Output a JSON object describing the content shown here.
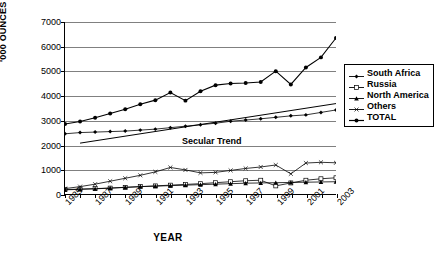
{
  "chart_data": {
    "type": "line",
    "title": "",
    "xlabel": "YEAR",
    "ylabel": "'000 OUNCES",
    "ylim": [
      0,
      7000
    ],
    "ytick_values": [
      0,
      1000,
      2000,
      3000,
      4000,
      5000,
      6000,
      7000
    ],
    "ytick_labels": [
      "0",
      "1000",
      "2000",
      "3000",
      "4000",
      "5000",
      "6000",
      "7000"
    ],
    "grid": true,
    "legend_position": "right",
    "x": [
      1985,
      1986,
      1987,
      1988,
      1989,
      1990,
      1991,
      1992,
      1993,
      1994,
      1995,
      1996,
      1997,
      1998,
      1999,
      2000,
      2001,
      2002,
      2003
    ],
    "xtick_labels": [
      "1985",
      "1987",
      "1989",
      "1991",
      "1993",
      "1995",
      "1997",
      "1999",
      "2001",
      "2003"
    ],
    "annotations": [
      {
        "text": "Secular Trend",
        "x": 1993,
        "y": 2150
      }
    ],
    "series": [
      {
        "name": "South Africa",
        "marker": "diamond",
        "values": [
          2450,
          2500,
          2520,
          2540,
          2560,
          2600,
          2640,
          2700,
          2760,
          2820,
          2880,
          2960,
          3010,
          3060,
          3120,
          3180,
          3220,
          3320,
          3420
        ]
      },
      {
        "name": "Russia",
        "marker": "square",
        "values": [
          180,
          200,
          220,
          240,
          270,
          300,
          330,
          360,
          390,
          420,
          460,
          500,
          540,
          560,
          330,
          450,
          560,
          620,
          660
        ]
      },
      {
        "name": "North America",
        "marker": "triangle",
        "values": [
          170,
          190,
          210,
          240,
          270,
          300,
          320,
          340,
          360,
          380,
          400,
          420,
          440,
          450,
          460,
          470,
          480,
          490,
          500
        ]
      },
      {
        "name": "Others",
        "marker": "cross",
        "values": [
          220,
          300,
          400,
          520,
          640,
          760,
          900,
          1080,
          980,
          860,
          880,
          960,
          1040,
          1100,
          1180,
          820,
          1260,
          1290,
          1270
        ]
      },
      {
        "name": "TOTAL",
        "marker": "circle",
        "values": [
          2850,
          2950,
          3100,
          3280,
          3450,
          3650,
          3820,
          4130,
          3800,
          4180,
          4430,
          4500,
          4520,
          4560,
          5000,
          4460,
          5150,
          5560,
          6350
        ]
      }
    ],
    "trend_line": {
      "name": "Secular Trend",
      "x": [
        1986,
        2003
      ],
      "y": [
        2070,
        3680
      ]
    }
  },
  "legend": {
    "items": [
      {
        "label": "South Africa"
      },
      {
        "label": "Russia"
      },
      {
        "label": "North America"
      },
      {
        "label": "Others"
      },
      {
        "label": "TOTAL"
      }
    ]
  }
}
